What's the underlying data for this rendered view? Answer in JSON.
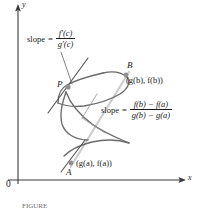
{
  "figure": {
    "kind": "cauchy-mean-value-theorem-parametric-curve",
    "axes": {
      "x_label": "x",
      "y_label": "y",
      "origin_label": "0"
    },
    "points": [
      {
        "id": "P",
        "name": "P",
        "coord_label": "",
        "x": 68,
        "y": 87
      },
      {
        "id": "B",
        "name": "B",
        "coord_label": "(g(b), f(b))",
        "x": 126,
        "y": 75
      },
      {
        "id": "A",
        "name": "A",
        "coord_label": "(g(a), f(a))",
        "x": 72,
        "y": 163
      }
    ],
    "annotations": {
      "tangent_slope": {
        "word": "slope",
        "equals": "=",
        "numerator": "f′(c)",
        "denominator": "g′(c)"
      },
      "secant_slope": {
        "word": "slope",
        "equals": "=",
        "numerator": "f(b) − f(a)",
        "denominator": "g(b) − g(a)"
      }
    },
    "colors": {
      "curve": "#6b6b6b",
      "tangent_line": "#555555",
      "secant_line": "#c9c9c9",
      "axis": "#3a3a3a",
      "point_marker": "#8a8a8a",
      "text": "#1a1a1a",
      "caption": "#6e6e6e"
    },
    "caption": "FIGURE"
  }
}
